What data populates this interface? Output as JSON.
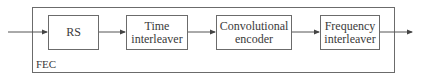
{
  "diagram": {
    "container_label": "FEC",
    "blocks": [
      {
        "id": "rs",
        "label": "RS"
      },
      {
        "id": "time-interleaver",
        "label_lines": [
          "Time",
          "interleaver"
        ]
      },
      {
        "id": "convolutional-encoder",
        "label_lines": [
          "Convolutional",
          "encoder"
        ]
      },
      {
        "id": "frequency-interleaver",
        "label_lines": [
          "Frequency",
          "interleaver"
        ]
      }
    ],
    "flow": [
      "input",
      "rs",
      "time-interleaver",
      "convolutional-encoder",
      "frequency-interleaver",
      "output"
    ]
  },
  "colors": {
    "stroke": "#6b6b6b",
    "text": "#3a3a3a",
    "background": "#ffffff"
  }
}
